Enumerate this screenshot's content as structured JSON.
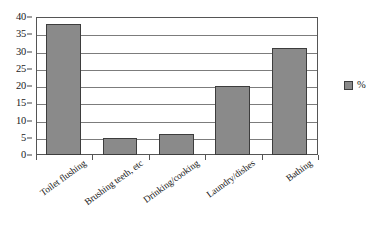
{
  "chart_data": {
    "type": "bar",
    "title": "",
    "xlabel": "",
    "ylabel": "",
    "categories": [
      "Toilet flushing",
      "Brushing teeth, etc",
      "Drinking/cooking",
      "Laundry/dishes",
      "Bathing"
    ],
    "series": [
      {
        "name": "%",
        "values": [
          38,
          5,
          6,
          20,
          31
        ],
        "color": "#8a8a8a"
      }
    ],
    "ylim": [
      0,
      40
    ],
    "ytick_values": [
      0,
      5,
      10,
      15,
      20,
      25,
      30,
      35,
      40
    ],
    "ytick_labels": [
      "0",
      "5",
      "10",
      "15",
      "20",
      "25",
      "30",
      "35",
      "40"
    ],
    "grid": true,
    "legend_position": "right",
    "legend_entries": [
      "%"
    ]
  },
  "legend": {
    "label": "%"
  },
  "artifacts": {
    "bleed_text_top": "",
    "bleed_text_bottom": ""
  }
}
